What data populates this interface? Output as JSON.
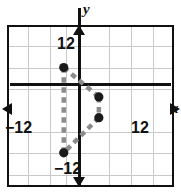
{
  "figure": {
    "type": "coordinate-plane-graph",
    "axis_labels": {
      "x": "x",
      "y": "y"
    },
    "tick_labels": {
      "y_positive": "12",
      "y_negative": "−12",
      "x_negative": "−12",
      "x_positive": "12"
    },
    "colors": {
      "axis": "#111111",
      "grid": "#c9c9c9",
      "frame": "#111111",
      "vertex": "#1a1a1a",
      "edge": "#8c8c8c",
      "background": "#ffffff"
    }
  },
  "chart_data": {
    "type": "scatter",
    "title": "",
    "xlabel": "x",
    "ylabel": "y",
    "xlim": [
      -12.75,
      12.75
    ],
    "ylim": [
      -13.5,
      12.0
    ],
    "xticks": [
      -12,
      12
    ],
    "yticks": [
      -12,
      12
    ],
    "grid": true,
    "grid_spacing": 3,
    "legend": "none",
    "series": [
      {
        "name": "quadrilateral",
        "closed": true,
        "style": "dashed",
        "edge_color": "#8c8c8c",
        "vertex_color": "#1a1a1a",
        "x": [
          -2.2,
          2.7,
          2.7,
          -2.2
        ],
        "y": [
          6.0,
          1.9,
          -1.0,
          -5.9
        ],
        "labels": [
          "A",
          "B",
          "C",
          "D"
        ]
      }
    ]
  }
}
